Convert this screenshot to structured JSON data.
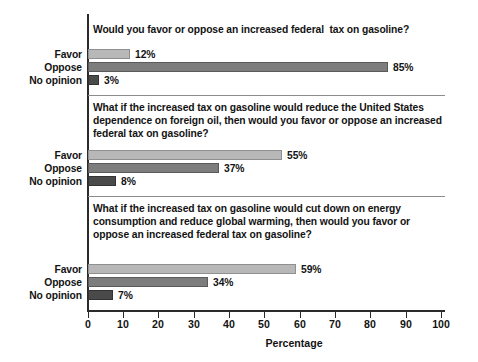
{
  "chart_data": {
    "type": "bar",
    "orientation": "horizontal",
    "title": "",
    "xlabel": "Percentage",
    "ylabel": "",
    "xlim": [
      0,
      100
    ],
    "xticks": [
      0,
      10,
      20,
      30,
      40,
      50,
      60,
      70,
      80,
      90,
      100
    ],
    "grid": false,
    "legend": "none",
    "categories": [
      "Favor",
      "Oppose",
      "No opinion"
    ],
    "colors": {
      "favor": "#b8b8b8",
      "oppose": "#7d7d7d",
      "no_opinion": "#4a4a4a",
      "axis": "#2b2b2b",
      "separator": "#8c8c8c",
      "text": "#131313",
      "background": "#ffffff"
    },
    "groups": [
      {
        "question": "Would you favor or oppose an increased federal  tax on gasoline?",
        "bars": [
          {
            "label": "Favor",
            "value": 12,
            "value_label": "12%"
          },
          {
            "label": "Oppose",
            "value": 85,
            "value_label": "85%"
          },
          {
            "label": "No opinion",
            "value": 3,
            "value_label": "3%"
          }
        ]
      },
      {
        "question": "What if the increased tax on gasoline would reduce the United States dependence on foreign oil, then would you favor or oppose an increased federal tax on gasoline?",
        "bars": [
          {
            "label": "Favor",
            "value": 55,
            "value_label": "55%"
          },
          {
            "label": "Oppose",
            "value": 37,
            "value_label": "37%"
          },
          {
            "label": "No opinion",
            "value": 8,
            "value_label": "8%"
          }
        ]
      },
      {
        "question": "What if the increased tax on gasoline would cut down on energy consumption and reduce global warming, then would you favor or oppose an increased federal tax on gasoline?",
        "bars": [
          {
            "label": "Favor",
            "value": 59,
            "value_label": "59%"
          },
          {
            "label": "Oppose",
            "value": 34,
            "value_label": "34%"
          },
          {
            "label": "No opinion",
            "value": 7,
            "value_label": "7%"
          }
        ]
      }
    ]
  }
}
